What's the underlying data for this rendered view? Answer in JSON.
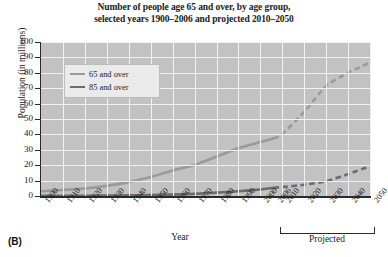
{
  "figure": {
    "panel_label": "(B)",
    "title_line1": "Number of people age 65 and over, by age group,",
    "title_line2": "selected years 1900–2006 and projected 2010–2050"
  },
  "legend": {
    "position": "upper-left-inside",
    "entries": [
      {
        "label": "65 and over",
        "color": "#9a9a9a"
      },
      {
        "label": "85 and over",
        "color": "#6b6b6b"
      }
    ]
  },
  "annotations": {
    "projected_bracket_label": "Projected",
    "projected_range": "2010–2050"
  },
  "colors": {
    "plot_background": "#c2c2c2",
    "gridline": "#f2f2f2",
    "axis": "#2a2a2a",
    "series_65": "#9a9a9a",
    "series_85": "#6b6b6b",
    "legend_background": "#eaeaea",
    "text": "#1a1a1a"
  },
  "chart_data": {
    "type": "line",
    "title": "Number of people age 65 and over, by age group, selected years 1900–2006 and projected 2010–2050",
    "xlabel": "Year",
    "ylabel": "Population (in millions)",
    "ylim": [
      0,
      100
    ],
    "yticks": [
      0,
      10,
      20,
      30,
      40,
      50,
      60,
      70,
      80,
      90,
      100
    ],
    "categories": [
      "1900",
      "1910",
      "1920",
      "1930",
      "1940",
      "1950",
      "1960",
      "1970",
      "1980",
      "1990",
      "2000",
      "2006",
      "2010",
      "2020",
      "2030",
      "2040",
      "2050"
    ],
    "grid": true,
    "legend_position": "upper left",
    "series": [
      {
        "name": "65 and over",
        "color": "#9a9a9a",
        "values": [
          3.1,
          3.9,
          4.9,
          6.6,
          9.0,
          12.3,
          16.6,
          20.1,
          25.5,
          31.2,
          35.0,
          37.3,
          40.2,
          54.6,
          71.5,
          80.0,
          86.7
        ],
        "solid_through": "2006",
        "dashed_from": "2006"
      },
      {
        "name": "85 and over",
        "color": "#6b6b6b",
        "values": [
          0.1,
          0.2,
          0.2,
          0.3,
          0.4,
          0.6,
          0.9,
          1.4,
          2.2,
          3.1,
          4.2,
          5.3,
          5.8,
          7.3,
          9.6,
          14.2,
          19.4
        ],
        "solid_through": "2006",
        "dashed_from": "2006"
      }
    ]
  }
}
